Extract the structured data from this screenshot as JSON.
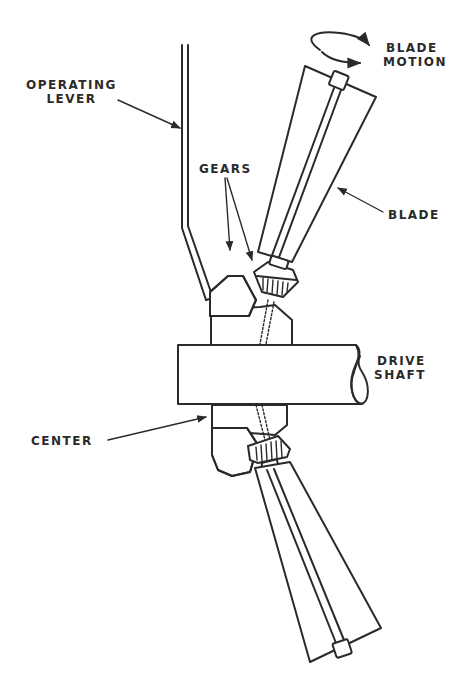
{
  "diagram": {
    "type": "mechanical cross-section",
    "labels": {
      "operating_lever": [
        "OPERATING",
        "LEVER"
      ],
      "blade_motion": [
        "BLADE",
        "MOTION"
      ],
      "gears": "GEARS",
      "blade": "BLADE",
      "drive_shaft": [
        "DRIVE",
        "SHAFT"
      ],
      "center": "CENTER"
    },
    "colors": {
      "ink": "#2a2a2a",
      "background": "#ffffff"
    }
  }
}
